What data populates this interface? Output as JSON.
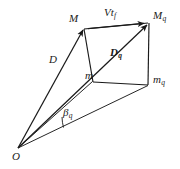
{
  "figure": {
    "type": "vector-geometry-diagram",
    "width": 180,
    "height": 169,
    "background_color": "#ffffff",
    "stroke_color": "#1a1a1a",
    "labels": {
      "origin": "O",
      "point_m_upper": "M",
      "point_mq_upper_base": "M",
      "point_mq_upper_sub": "q",
      "point_m_lower": "m",
      "point_mq_lower_base": "m",
      "point_mq_lower_sub": "q",
      "vector_d": "D",
      "vector_dq_base": "D",
      "vector_dq_sub": "q",
      "vector_vtf_base": "Vt",
      "vector_vtf_sub": "f",
      "angle_beta_base": "β",
      "angle_beta_sub": "q"
    },
    "vertices": {
      "O": [
        18,
        148
      ],
      "M": [
        84,
        27
      ],
      "Mq": [
        149,
        22
      ],
      "m": [
        93,
        81
      ],
      "mq": [
        148,
        85
      ]
    }
  }
}
